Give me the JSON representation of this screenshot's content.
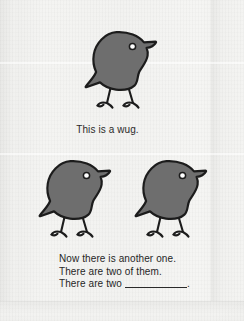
{
  "page": {
    "kind": "scanned-worksheet-page",
    "background_color": "#f2f2f0",
    "ink_color": "#262626"
  },
  "illustration": {
    "creature_name": "wug",
    "body_color": "#6e6e6e",
    "outline_color": "#1c1c1c",
    "eye_color": "#ffffff",
    "figures": [
      {
        "id": "wug-top",
        "label": "wug-figure-top"
      },
      {
        "id": "wug-left",
        "label": "wug-figure-bottom-left"
      },
      {
        "id": "wug-right",
        "label": "wug-figure-bottom-right"
      }
    ]
  },
  "captions": {
    "single": "This is a wug.",
    "plural_lines": [
      "Now there is another one.",
      "There are two of them."
    ],
    "prompt_prefix": "There are two",
    "prompt_blank": "",
    "prompt_suffix": "."
  }
}
